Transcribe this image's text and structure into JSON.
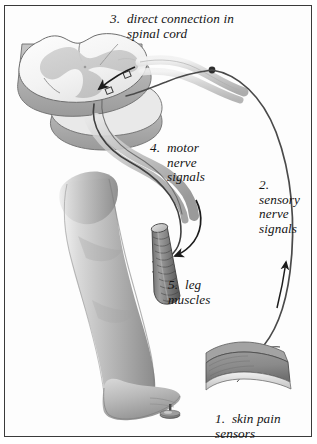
{
  "figure": {
    "border_color": "#3a3a3a",
    "background_color": "#ffffff",
    "width": 317,
    "height": 444
  },
  "labels": {
    "item1": {
      "number": "1.",
      "text": "skin pain\nsensors",
      "full": "1.  skin pain\nsensors"
    },
    "item2": {
      "number": "2.",
      "text": "sensory\nnerve\nsignals",
      "full": "2.\nsensory\nnerve\nsignals"
    },
    "item3": {
      "number": "3.",
      "text": "direct connection in\nspinal cord",
      "full": "3.  direct connection in\n     spinal cord"
    },
    "item4": {
      "number": "4.",
      "text": "motor\nnerve\nsignals",
      "full": "4.  motor\n     nerve\n     signals"
    },
    "item5": {
      "number": "5.",
      "text": "leg\nmuscles",
      "full": "5.  leg\nmuscles"
    }
  },
  "anatomy": {
    "spinal_cord": "spinal-cord-cross-section",
    "gray_matter": "butterfly-gray-matter",
    "dorsal_root_ganglion": "ganglion-node",
    "sensory_nerve": "sensory-nerve-fiber",
    "motor_nerve": "motor-nerve-fiber",
    "leg": "human-leg",
    "foot": "human-foot",
    "muscle": "leg-muscle-bundle",
    "skin_patch": "skin-pain-sensor-block",
    "tack": "thumbtack"
  },
  "colors": {
    "outline": "#3a3a3a",
    "nerve_dark": "#4a4a4a",
    "nerve_mid": "#8d8d8d",
    "white_matter": "#f7f7f7",
    "gray_matter": "#c9c9c9",
    "cord_side": "#b4b4b4",
    "leg_light": "#d6d6d6",
    "leg_mid": "#b0b0b0",
    "leg_shadow": "#8f8f8f",
    "muscle": "#777777",
    "skin_block": "#8a8a8a",
    "text": "#141414"
  }
}
